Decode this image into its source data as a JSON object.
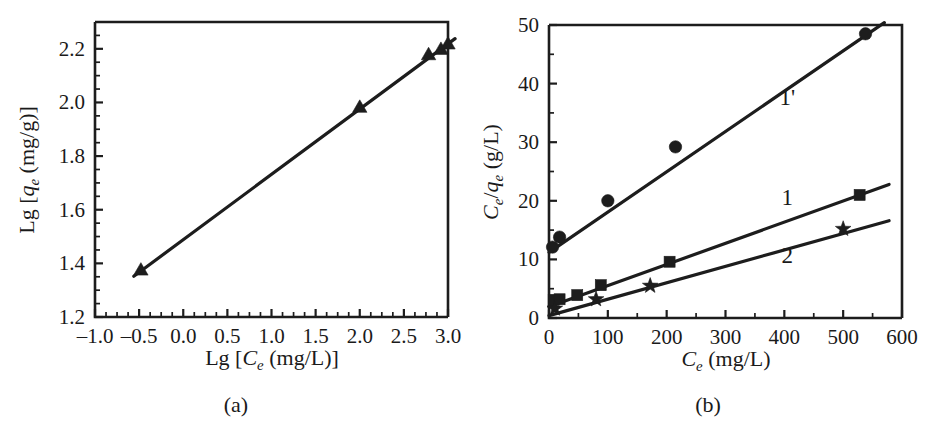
{
  "figure": {
    "background_color": "#ffffff",
    "ink_color": "#1d1d1d",
    "panels": [
      {
        "caption": "(a)"
      },
      {
        "caption": "(b)"
      }
    ]
  },
  "chart_data": [
    {
      "type": "scatter",
      "panel": "(a)",
      "title": "",
      "xlabel": "Lg [Ce (mg/L)]",
      "xlabel_parts": {
        "prefix": "Lg [",
        "var": "C",
        "sub": "e",
        "suffix": " (mg/L)]"
      },
      "ylabel": "Lg [qe (mg/g)]",
      "ylabel_parts": {
        "prefix": "Lg [",
        "var": "q",
        "sub": "e",
        "suffix": " (mg/g)]"
      },
      "xlim": [
        -1.0,
        3.0
      ],
      "ylim": [
        1.2,
        2.3
      ],
      "xticks": [
        -1.0,
        -0.5,
        0.0,
        0.5,
        1.0,
        1.5,
        2.0,
        2.5,
        3.0
      ],
      "xticklabels": [
        "–1.0",
        "–0.5",
        "0.0",
        "0.5",
        "1.0",
        "1.5",
        "2.0",
        "2.5",
        "3.0"
      ],
      "yticks": [
        1.2,
        1.4,
        1.6,
        1.8,
        2.0,
        2.2
      ],
      "yticklabels": [
        "1.2",
        "1.4",
        "1.6",
        "1.8",
        "2.0",
        "2.2"
      ],
      "x_minor_step": 0.125,
      "y_minor_step": 0.05,
      "grid": false,
      "legend": "none",
      "series": [
        {
          "name": "Freundlich fit",
          "marker": "triangle",
          "points": [
            {
              "x": -0.48,
              "y": 1.375
            },
            {
              "x": 2.0,
              "y": 1.982
            },
            {
              "x": 2.78,
              "y": 2.178
            },
            {
              "x": 2.92,
              "y": 2.198
            },
            {
              "x": 3.0,
              "y": 2.218
            }
          ],
          "fit_line": {
            "x0": -0.56,
            "y0": 1.352,
            "x1": 3.08,
            "y1": 2.238
          }
        }
      ]
    },
    {
      "type": "scatter",
      "panel": "(b)",
      "title": "",
      "xlabel": "Ce (mg/L)",
      "xlabel_parts": {
        "prefix": "",
        "var": "C",
        "sub": "e",
        "suffix": " (mg/L)"
      },
      "ylabel": "Ce/qe (g/L)",
      "ylabel_parts": {
        "var1": "C",
        "sub1": "e",
        "slash": "/",
        "var2": "q",
        "sub2": "e",
        "suffix": " (g/L)"
      },
      "xlim": [
        0,
        600
      ],
      "ylim": [
        0,
        50
      ],
      "xticks": [
        0,
        100,
        200,
        300,
        400,
        500,
        600
      ],
      "xticklabels": [
        "0",
        "100",
        "200",
        "300",
        "400",
        "500",
        "600"
      ],
      "yticks": [
        0,
        10,
        20,
        30,
        40,
        50
      ],
      "yticklabels": [
        "0",
        "10",
        "20",
        "30",
        "40",
        "50"
      ],
      "x_minor_step": 50,
      "y_minor_step": 5,
      "grid": false,
      "legend": "inline-labels",
      "series": [
        {
          "name": "1'",
          "label": "1'",
          "label_x": 405,
          "label_y": 37.5,
          "marker": "circle",
          "points": [
            {
              "x": 6,
              "y": 12.1
            },
            {
              "x": 18,
              "y": 13.8
            },
            {
              "x": 100,
              "y": 20.0
            },
            {
              "x": 215,
              "y": 29.2
            },
            {
              "x": 538,
              "y": 48.5
            }
          ],
          "fit_line": {
            "x0": 0,
            "y0": 11.2,
            "x1": 570,
            "y1": 50.4
          }
        },
        {
          "name": "1",
          "label": "1",
          "label_x": 405,
          "label_y": 20.5,
          "marker": "square",
          "points": [
            {
              "x": 8,
              "y": 3.1
            },
            {
              "x": 18,
              "y": 3.2
            },
            {
              "x": 48,
              "y": 3.9
            },
            {
              "x": 88,
              "y": 5.6
            },
            {
              "x": 205,
              "y": 9.6
            },
            {
              "x": 528,
              "y": 21.0
            }
          ],
          "fit_line": {
            "x0": 0,
            "y0": 1.9,
            "x1": 578,
            "y1": 22.8
          }
        },
        {
          "name": "2",
          "label": "2",
          "label_x": 405,
          "label_y": 10.5,
          "marker": "star",
          "points": [
            {
              "x": 10,
              "y": 1.6
            },
            {
              "x": 80,
              "y": 3.2
            },
            {
              "x": 172,
              "y": 5.5
            },
            {
              "x": 500,
              "y": 15.2
            }
          ],
          "fit_line": {
            "x0": 0,
            "y0": 0.4,
            "x1": 578,
            "y1": 16.6
          }
        }
      ]
    }
  ]
}
